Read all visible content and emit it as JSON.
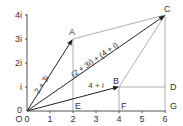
{
  "diagram": {
    "colors": {
      "axis": "#555555",
      "vector": "#222222",
      "construction": "#999999",
      "text": "#333333"
    },
    "axes": {
      "x_ticks": [
        "0",
        "1",
        "2",
        "3",
        "4",
        "5",
        "6"
      ],
      "y_ticks": [
        "0",
        "i",
        "2i",
        "3i",
        "4i"
      ],
      "origin_label": "O"
    },
    "points": {
      "A": "A",
      "B": "B",
      "C": "C",
      "D": "D",
      "E": "E",
      "F": "F",
      "G": "G"
    },
    "vectors": {
      "OA": "2 + 3i",
      "OB": "4 + i",
      "OC": "(2 + 3i) + (4 + i)"
    }
  }
}
